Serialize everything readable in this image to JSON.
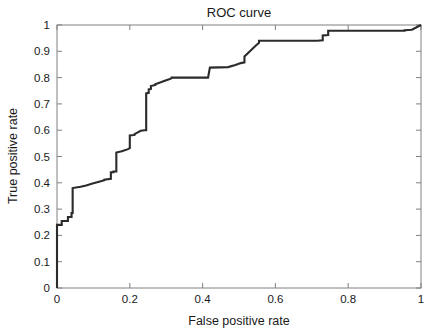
{
  "chart_data": {
    "type": "line",
    "title": "ROC curve",
    "xlabel": "False positive rate",
    "ylabel": "True positive rate",
    "xlim": [
      0,
      1
    ],
    "ylim": [
      0,
      1
    ],
    "grid": false,
    "legend": null,
    "xticks": [
      0,
      0.2,
      0.4,
      0.6,
      0.8,
      1
    ],
    "yticks": [
      0,
      0.1,
      0.2,
      0.3,
      0.4,
      0.5,
      0.6,
      0.7,
      0.8,
      0.9,
      1
    ],
    "xtick_labels": [
      "0",
      "0.2",
      "0.4",
      "0.6",
      "0.8",
      "1"
    ],
    "ytick_labels": [
      "0",
      "0.1",
      "0.2",
      "0.3",
      "0.4",
      "0.5",
      "0.6",
      "0.7",
      "0.8",
      "0.9",
      "1"
    ],
    "series": [
      {
        "name": "ROC curve",
        "drawstyle": "steps-post",
        "color": "#2b2b2b",
        "x": [
          0.0,
          0.0,
          0.013,
          0.013,
          0.03,
          0.03,
          0.04,
          0.04,
          0.043,
          0.043,
          0.065,
          0.08,
          0.1,
          0.118,
          0.13,
          0.13,
          0.148,
          0.148,
          0.155,
          0.155,
          0.163,
          0.163,
          0.178,
          0.195,
          0.2,
          0.2,
          0.213,
          0.213,
          0.222,
          0.23,
          0.24,
          0.24,
          0.245,
          0.245,
          0.252,
          0.252,
          0.258,
          0.258,
          0.27,
          0.27,
          0.285,
          0.3,
          0.31,
          0.315,
          0.315,
          0.415,
          0.415,
          0.42,
          0.47,
          0.49,
          0.505,
          0.515,
          0.515,
          0.53,
          0.545,
          0.555,
          0.555,
          0.715,
          0.715,
          0.73,
          0.73,
          0.745,
          0.745,
          0.955,
          0.955,
          0.975,
          1.0
        ],
        "y": [
          0.0,
          0.24,
          0.24,
          0.255,
          0.255,
          0.27,
          0.27,
          0.285,
          0.285,
          0.38,
          0.385,
          0.39,
          0.398,
          0.405,
          0.41,
          0.412,
          0.415,
          0.44,
          0.44,
          0.443,
          0.443,
          0.515,
          0.52,
          0.528,
          0.532,
          0.58,
          0.582,
          0.585,
          0.592,
          0.598,
          0.6,
          0.6,
          0.6,
          0.74,
          0.742,
          0.755,
          0.757,
          0.768,
          0.772,
          0.775,
          0.782,
          0.79,
          0.795,
          0.798,
          0.8,
          0.8,
          0.8,
          0.838,
          0.84,
          0.848,
          0.855,
          0.858,
          0.88,
          0.9,
          0.92,
          0.932,
          0.94,
          0.94,
          0.94,
          0.942,
          0.96,
          0.962,
          0.978,
          0.978,
          0.98,
          0.982,
          1.0
        ]
      }
    ]
  },
  "plot_area": {
    "left": 57,
    "right": 421,
    "top": 25,
    "bottom": 288
  }
}
